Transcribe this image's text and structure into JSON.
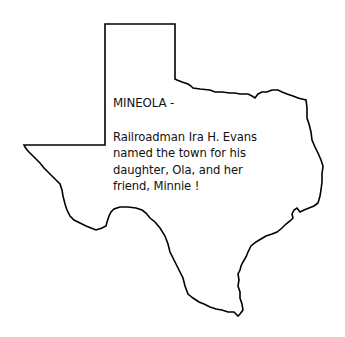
{
  "card": {
    "title": "MINEOLA -",
    "body": "Railroadman Ira H. Evans\nnamed the town for his\ndaughter, Ola, and her\nfriend, Minnie !"
  },
  "map": {
    "shape": "texas-outline",
    "stroke_color": "#000000",
    "fill_color": "#ffffff"
  }
}
